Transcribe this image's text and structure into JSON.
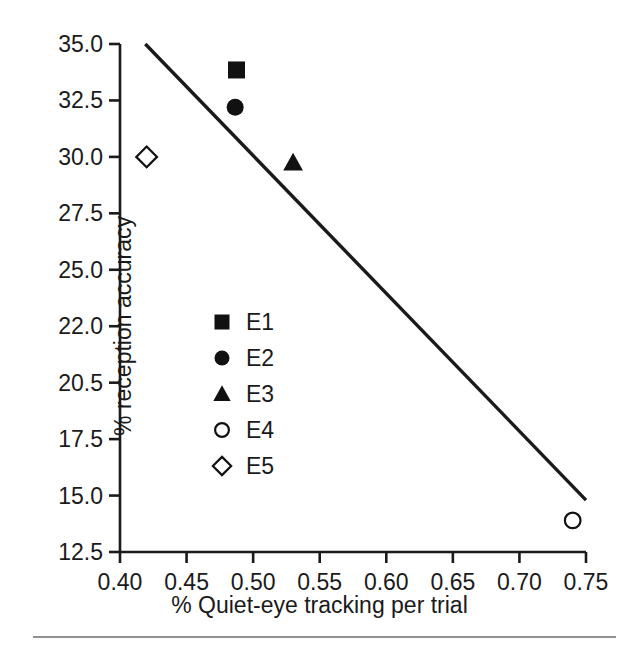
{
  "chart_data": {
    "type": "scatter",
    "title": "",
    "xlabel": "% Quiet-eye tracking per trial",
    "ylabel": "% reception accuracy",
    "xlim": [
      0.4,
      0.75
    ],
    "ylim": [
      12.5,
      35.0
    ],
    "grid": false,
    "legend_position": "center-left",
    "x_tick_labels": [
      "0.40",
      "0.45",
      "0.50",
      "0.55",
      "0.60",
      "0.65",
      "0.70",
      "0.75"
    ],
    "x_tick_values": [
      0.4,
      0.45,
      0.5,
      0.55,
      0.6,
      0.65,
      0.7,
      0.75
    ],
    "y_tick_labels": [
      "35.0",
      "32.5",
      "30.0",
      "27.5",
      "25.0",
      "22.0",
      "20.5",
      "17.5",
      "15.0",
      "12.5"
    ],
    "y_tick_values": [
      35.0,
      32.5,
      30.0,
      27.5,
      25.0,
      22.5,
      20.0,
      17.5,
      15.0,
      12.5
    ],
    "series": [
      {
        "name": "E1",
        "marker": "filled-square",
        "x": [
          0.4875
        ],
        "y": [
          33.85
        ]
      },
      {
        "name": "E2",
        "marker": "filled-circle",
        "x": [
          0.4865
        ],
        "y": [
          32.2
        ]
      },
      {
        "name": "E3",
        "marker": "filled-triangle",
        "x": [
          0.53
        ],
        "y": [
          29.75
        ]
      },
      {
        "name": "E4",
        "marker": "open-circle",
        "x": [
          0.74
        ],
        "y": [
          13.9
        ]
      },
      {
        "name": "E5",
        "marker": "open-diamond",
        "x": [
          0.42
        ],
        "y": [
          30.0
        ]
      }
    ],
    "trendline": {
      "name": "regression-line",
      "x_start": 0.419,
      "y_start": 35.0,
      "x_end": 0.75,
      "y_end": 14.8
    },
    "legend_entries": [
      {
        "label": "E1",
        "marker": "filled-square"
      },
      {
        "label": "E2",
        "marker": "filled-circle"
      },
      {
        "label": "E3",
        "marker": "filled-triangle"
      },
      {
        "label": "E4",
        "marker": "open-circle"
      },
      {
        "label": "E5",
        "marker": "open-diamond"
      }
    ],
    "colors": {
      "axis": "#1a1a1a",
      "marker": "#111111",
      "trendline": "#1a1a1a",
      "background": "#ffffff",
      "footer_rule": "#6b6b6b"
    }
  }
}
